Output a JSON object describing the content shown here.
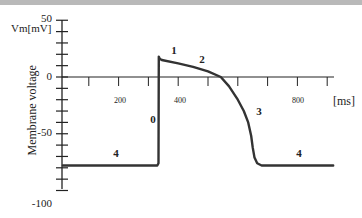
{
  "chart_data": {
    "type": "line",
    "title": "",
    "xlabel": "[ms]",
    "ylabel": "Membrane voltage",
    "yunit_label": "Vm[mV]",
    "xlim": [
      0,
      920
    ],
    "ylim": [
      -100,
      50
    ],
    "grid": false,
    "legend": null,
    "x_ticks": [
      100,
      200,
      300,
      400,
      500,
      600,
      700,
      800,
      900
    ],
    "x_tick_labels": [
      {
        "value": 200,
        "label": "200"
      },
      {
        "value": 400,
        "label": "400"
      },
      {
        "value": 800,
        "label": "800"
      }
    ],
    "y_ticks": [
      50,
      40,
      30,
      20,
      10,
      0,
      -10,
      -20,
      -30,
      -40,
      -50,
      -60,
      -70,
      -80,
      -90,
      -100
    ],
    "y_tick_labels": [
      {
        "value": 50,
        "label": "50"
      },
      {
        "value": 0,
        "label": "0"
      },
      {
        "value": -50,
        "label": "-50"
      },
      {
        "value": -100,
        "label": "-100"
      }
    ],
    "series": [
      {
        "name": "Action potential",
        "color": "#333333",
        "points": [
          [
            13,
            -78
          ],
          [
            200,
            -78
          ],
          [
            330,
            -78
          ],
          [
            334,
            -76
          ],
          [
            335,
            18
          ],
          [
            338,
            16
          ],
          [
            345,
            15
          ],
          [
            400,
            12
          ],
          [
            450,
            9
          ],
          [
            500,
            5
          ],
          [
            543,
            0
          ],
          [
            570,
            -8
          ],
          [
            600,
            -20
          ],
          [
            620,
            -30
          ],
          [
            635,
            -40
          ],
          [
            645,
            -52
          ],
          [
            650,
            -62
          ],
          [
            656,
            -71
          ],
          [
            665,
            -76
          ],
          [
            680,
            -78
          ],
          [
            700,
            -78
          ],
          [
            920,
            -78
          ]
        ]
      }
    ],
    "annotations": [
      {
        "text": "0",
        "x": 310,
        "y": -37,
        "meaning": "phase 0 (depolarization)"
      },
      {
        "text": "1",
        "x": 380,
        "y": 23,
        "meaning": "phase 1"
      },
      {
        "text": "2",
        "x": 477,
        "y": 15,
        "meaning": "phase 2 (plateau)"
      },
      {
        "text": "3",
        "x": 663,
        "y": -31,
        "meaning": "phase 3 (repolarization)"
      },
      {
        "text": "4",
        "x": 190,
        "y": -68,
        "meaning": "phase 4 (resting)"
      },
      {
        "text": "4",
        "x": 800,
        "y": -68,
        "meaning": "phase 4 (resting)"
      }
    ]
  },
  "labels": {
    "y_unit": "Vm[mV]",
    "y_axis_title": "Membrane voltage",
    "x_unit": "[ms]",
    "y50": "50",
    "y0": "0",
    "ym50": "-50",
    "ym100": "-100",
    "x200": "200",
    "x400": "400",
    "x800": "800",
    "phase0": "0",
    "phase1": "1",
    "phase2": "2",
    "phase3": "3",
    "phase4a": "4",
    "phase4b": "4"
  },
  "colors": {
    "trace": "#333333",
    "axis": "#222222",
    "topbar": "#b9b9b9"
  }
}
